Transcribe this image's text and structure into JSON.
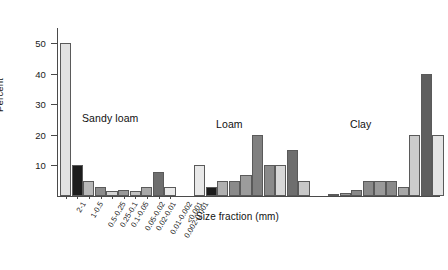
{
  "chart_data": {
    "type": "bar",
    "title": "",
    "xlabel": "Size fraction (mm)",
    "ylabel": "Percent",
    "ylim": [
      0,
      55
    ],
    "yticks": [
      10,
      20,
      30,
      40,
      50
    ],
    "grid": false,
    "legend_position": "none",
    "group_labels": [
      "Sandy loam",
      "Loam",
      "Clay"
    ],
    "categories": [
      "2-1",
      "1-0.5",
      "0.5-0.25",
      "0.25-0.1",
      "0.1-0.05",
      "0.05-0.02",
      "0.02-0.01",
      "0.01-0.002",
      "0.002-0.001",
      "<0.001"
    ],
    "series": [
      {
        "name": "Sandy loam",
        "values": [
          50,
          10,
          5,
          3,
          1.5,
          2,
          1.5,
          3,
          8,
          3
        ],
        "colors": [
          "#e2e2e2",
          "#1c1c1c",
          "#b8b8b8",
          "#8c8c8c",
          "#d6d6d6",
          "#9a9a9a",
          "#c2c2c2",
          "#a8a8a8",
          "#6e6e6e",
          "#e8e8e8"
        ]
      },
      {
        "name": "Loam",
        "values": [
          10,
          3,
          5,
          5,
          7,
          20,
          10,
          10,
          15,
          5
        ],
        "colors": [
          "#e8e8e8",
          "#1c1c1c",
          "#b0b0b0",
          "#8a8a8a",
          "#9c9c9c",
          "#808080",
          "#8a8a8a",
          "#d8d8d8",
          "#6e6e6e",
          "#c8c8c8"
        ]
      },
      {
        "name": "Clay",
        "values": [
          0.5,
          1,
          2,
          5,
          5,
          5,
          3,
          20,
          40,
          20
        ],
        "colors": [
          "#bdbdbd",
          "#9a9a9a",
          "#8a8a8a",
          "#8a8a8a",
          "#9a9a9a",
          "#8a8a8a",
          "#a8a8a8",
          "#cccccc",
          "#5e5e5e",
          "#e4e4e4"
        ]
      }
    ]
  },
  "axis": {
    "y_title": "Percent",
    "x_title": "Size fraction (mm)"
  }
}
